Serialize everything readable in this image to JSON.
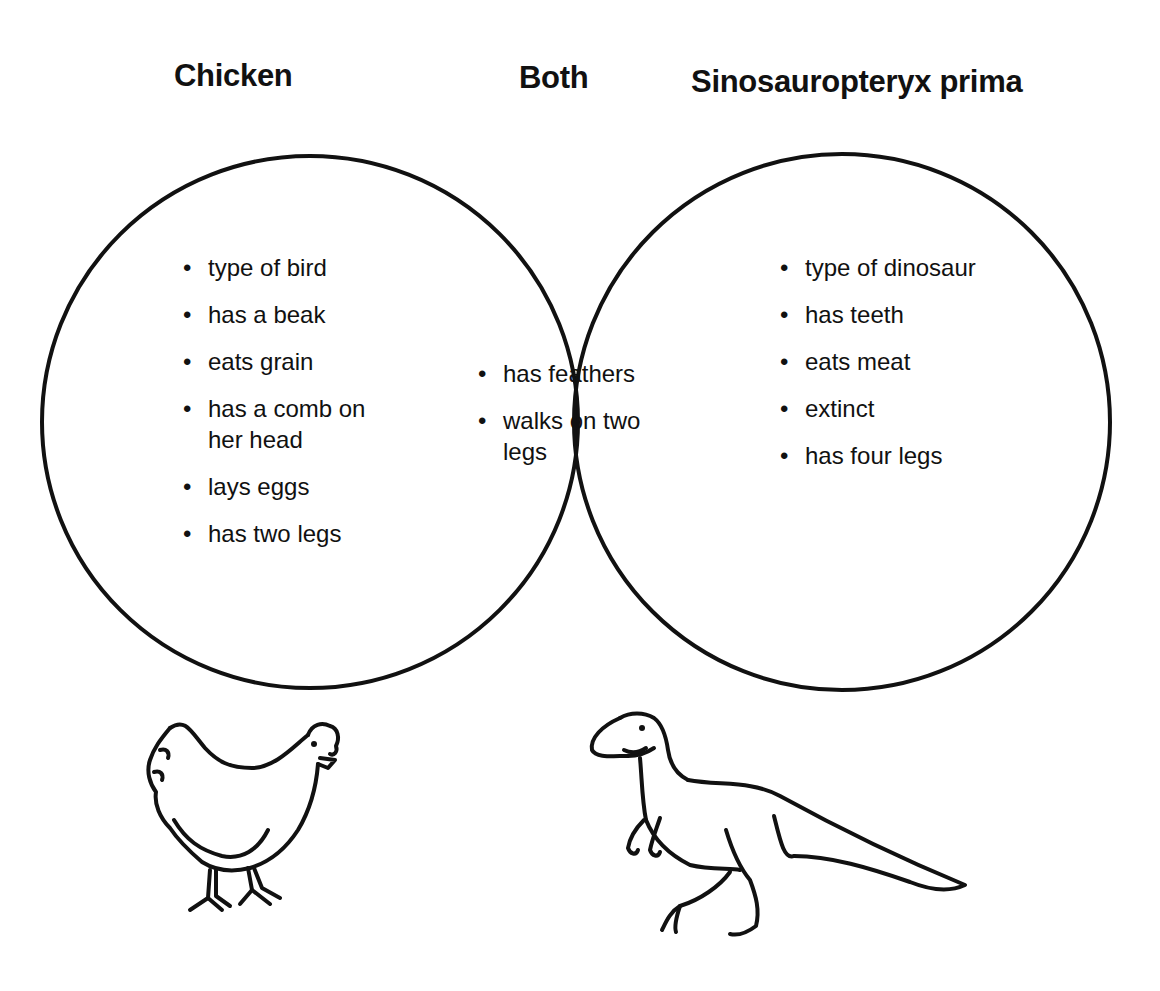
{
  "diagram": {
    "type": "venn",
    "sets": [
      {
        "label": "Chicken",
        "items": [
          "type of bird",
          "has a beak",
          "eats grain",
          "has a comb on her head",
          "lays eggs",
          "has two legs"
        ]
      },
      {
        "label": "Both",
        "items": [
          "has feathers",
          "walks on two legs"
        ]
      },
      {
        "label": "Sinosauropteryx prima",
        "items": [
          "type of dinosaur",
          "has teeth",
          "eats meat",
          "extinct",
          "has four legs"
        ]
      }
    ],
    "illustrations": [
      "chicken-drawing",
      "dinosaur-drawing"
    ],
    "stroke_color": "#111111"
  }
}
